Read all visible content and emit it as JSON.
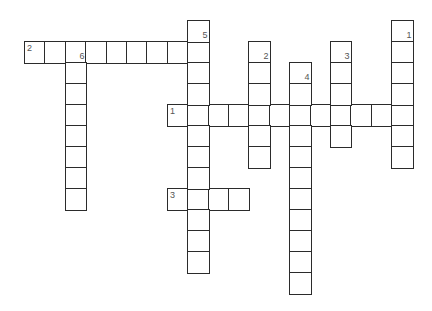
{
  "puzzle": {
    "grid": {
      "origin_x": 24,
      "origin_y": 20,
      "cell_w": 20.4,
      "cell_h": 21
    },
    "colors": {
      "border": "#2b2b2b",
      "fill": "#ffffff",
      "number": "#555555"
    },
    "words": [
      {
        "id": "across-2",
        "number": "2",
        "direction": "across",
        "row": 1,
        "col": 0,
        "length": 9
      },
      {
        "id": "across-1",
        "number": "1",
        "direction": "across",
        "row": 4,
        "col": 7,
        "length": 12
      },
      {
        "id": "across-3",
        "number": "3",
        "direction": "across",
        "row": 8,
        "col": 7,
        "length": 4
      },
      {
        "id": "down-5",
        "number": "5",
        "direction": "down",
        "row": 0,
        "col": 8,
        "length": 12
      },
      {
        "id": "down-6",
        "number": "6",
        "direction": "down",
        "row": 1,
        "col": 2,
        "length": 8
      },
      {
        "id": "down-2",
        "number": "2",
        "direction": "down",
        "row": 1,
        "col": 11,
        "length": 6
      },
      {
        "id": "down-4",
        "number": "4",
        "direction": "down",
        "row": 2,
        "col": 13,
        "length": 11
      },
      {
        "id": "down-3",
        "number": "3",
        "direction": "down",
        "row": 1,
        "col": 15,
        "length": 5
      },
      {
        "id": "down-1",
        "number": "1",
        "direction": "down",
        "row": 0,
        "col": 18,
        "length": 7
      }
    ]
  }
}
